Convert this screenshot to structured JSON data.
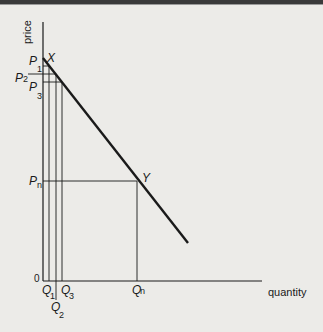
{
  "diagram": {
    "type": "demand-curve",
    "y_axis_label": "price",
    "x_axis_label": "quantity",
    "origin_label": "0",
    "points": [
      {
        "name": "X",
        "label": "X"
      },
      {
        "name": "Y",
        "label": "Y"
      }
    ],
    "price_labels": [
      {
        "main": "P",
        "sub": "1"
      },
      {
        "main": "P",
        "sub": "2"
      },
      {
        "main": "P",
        "sub": "3"
      },
      {
        "main": "P",
        "sub": "n"
      }
    ],
    "quantity_labels": [
      {
        "main": "Q",
        "sub": "1"
      },
      {
        "main": "Q",
        "sub": "2"
      },
      {
        "main": "Q",
        "sub": "3"
      },
      {
        "main": "Q",
        "sub": "n"
      }
    ],
    "colors": {
      "background": "#ecebe8",
      "ink": "#1a1a1a"
    }
  }
}
